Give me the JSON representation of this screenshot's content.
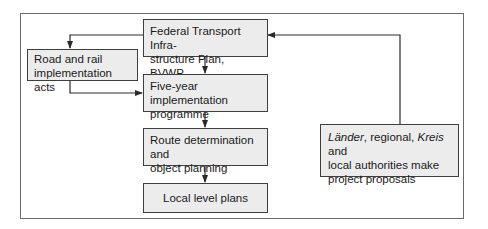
{
  "diagram": {
    "type": "flowchart",
    "boxes": {
      "federal": {
        "line1": "Federal Transport Infra-",
        "line2": "structure Plan, BVWP"
      },
      "road": {
        "line1": "Road and rail",
        "line2": "implementation acts"
      },
      "five_year": {
        "line1": "Five-year implementation",
        "line2": "programme"
      },
      "route": {
        "line1": "Route determination and",
        "line2": "object planning"
      },
      "local": {
        "label": "Local level plans"
      },
      "laender": {
        "italic1": "Länder",
        "text1": ", regional, ",
        "italic2": "Kreis",
        "text2": " and",
        "line2": "local authorities make",
        "line3": "project proposals"
      }
    },
    "edges": [
      {
        "from": "Federal Transport Infrastructure Plan, BVWP",
        "to": "Road and rail implementation acts"
      },
      {
        "from": "Federal Transport Infrastructure Plan, BVWP",
        "to": "Five-year implementation programme"
      },
      {
        "from": "Road and rail implementation acts",
        "to": "Five-year implementation programme"
      },
      {
        "from": "Five-year implementation programme",
        "to": "Route determination and object planning"
      },
      {
        "from": "Route determination and object planning",
        "to": "Local level plans"
      },
      {
        "from": "Länder, regional, Kreis and local authorities make project proposals",
        "to": "Federal Transport Infrastructure Plan, BVWP"
      }
    ],
    "colors": {
      "box_fill": "#ececec",
      "box_border": "#3e3e3e",
      "line": "#2a2a2a",
      "frame": "#6a6a6a"
    }
  }
}
